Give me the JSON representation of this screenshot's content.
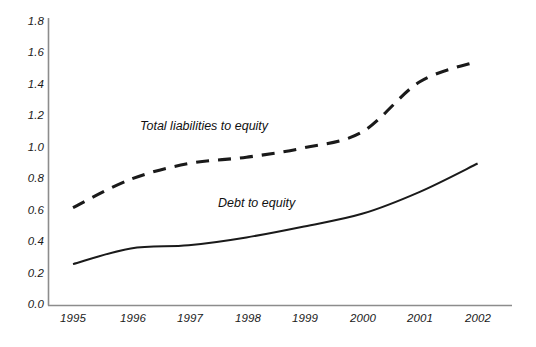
{
  "chart_data": {
    "type": "line",
    "title": "",
    "xlabel": "",
    "ylabel": "",
    "x": [
      1995,
      1996,
      1997,
      1998,
      1999,
      2000,
      2001,
      2002
    ],
    "xtick_labels": [
      "1995",
      "1996",
      "1997",
      "1998",
      "1999",
      "2000",
      "2001",
      "2002"
    ],
    "ytick_labels": [
      "0.0",
      "0.2",
      "0.4",
      "0.6",
      "0.8",
      "1.0",
      "1.2",
      "1.4",
      "1.6",
      "1.8"
    ],
    "ytick_values": [
      0.0,
      0.2,
      0.4,
      0.6,
      0.8,
      1.0,
      1.2,
      1.4,
      1.6,
      1.8
    ],
    "ylim": [
      0.0,
      1.8
    ],
    "xlim": [
      1995,
      2002
    ],
    "grid": false,
    "legend_position": "inline-annotations",
    "series": [
      {
        "name": "Total liabilities to equity",
        "style": "dashed",
        "color": "#1a1a1a",
        "values": [
          0.62,
          0.8,
          0.9,
          0.94,
          1.0,
          1.1,
          1.42,
          1.55
        ]
      },
      {
        "name": "Debt to equity",
        "style": "solid",
        "color": "#1a1a1a",
        "values": [
          0.26,
          0.36,
          0.38,
          0.43,
          0.5,
          0.58,
          0.72,
          0.9
        ]
      }
    ],
    "annotations": [
      {
        "text": "Total liabilities to equity",
        "x": 1996.9,
        "y": 1.18
      },
      {
        "text": "Debt to equity",
        "x": 1998.8,
        "y": 0.7
      }
    ]
  },
  "axes": {
    "y_axis_color": "#8c8c8c",
    "x_axis_color": "#8c8c8c"
  },
  "ticks": {
    "y": [
      {
        "label": "1.8"
      },
      {
        "label": "1.6"
      },
      {
        "label": "1.4"
      },
      {
        "label": "1.2"
      },
      {
        "label": "1.0"
      },
      {
        "label": "0.8"
      },
      {
        "label": "0.6"
      },
      {
        "label": "0.4"
      },
      {
        "label": "0.2"
      },
      {
        "label": "0.0"
      }
    ],
    "x": [
      {
        "label": "1995"
      },
      {
        "label": "1996"
      },
      {
        "label": "1997"
      },
      {
        "label": "1998"
      },
      {
        "label": "1999"
      },
      {
        "label": "2000"
      },
      {
        "label": "2001"
      },
      {
        "label": "2002"
      }
    ]
  },
  "annotations": {
    "total_liabilities": "Total liabilities to equity",
    "debt_to_equity": "Debt to equity"
  }
}
